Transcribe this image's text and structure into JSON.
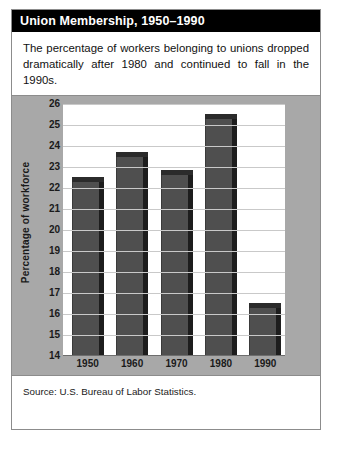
{
  "card": {
    "title": "Union Membership, 1950–1990",
    "intro": "The percentage of workers belonging to unions dropped dramatically after 1980 and continued to fall in the 1990s.",
    "source": "Source: U.S. Bureau of Labor Statistics."
  },
  "chart_data": {
    "type": "bar",
    "title": "Union Membership, 1950–1990",
    "categories": [
      "1950",
      "1960",
      "1970",
      "1980",
      "1990"
    ],
    "values": [
      22.3,
      23.5,
      22.6,
      25.3,
      16.3
    ],
    "xlabel": "Year",
    "ylabel": "Percentage of workforce",
    "ylim": [
      14,
      26
    ],
    "ytick_step": 1,
    "yticks": [
      14,
      15,
      16,
      17,
      18,
      19,
      20,
      21,
      22,
      23,
      24,
      25,
      26
    ],
    "grid": true,
    "legend": false,
    "style": "3d-columns",
    "colors": {
      "bar_face": "#4f4f4f",
      "bar_side": "#1d1d1d",
      "bar_top": "#2b2b2b",
      "panel": "#a8a8a8",
      "plot_background": "#ffffff",
      "gridline": "#c9c9c9",
      "title_banner": "#000000",
      "title_text": "#ffffff"
    }
  }
}
